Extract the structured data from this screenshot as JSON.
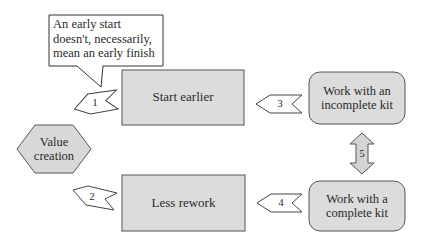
{
  "callout": {
    "text": "An early start doesn't, necessarily, mean an early finish"
  },
  "nodes": {
    "start_earlier": "Start earlier",
    "less_rework": "Less rework",
    "incomplete_kit": "Work with an incomplete kit",
    "complete_kit": "Work with a complete kit",
    "value_creation": "Value creation"
  },
  "arrows": {
    "a1": "1",
    "a2": "2",
    "a3": "3",
    "a4": "4",
    "a5": "5"
  },
  "colors": {
    "box_fill": "#dcdcdc",
    "box_stroke": "#555555",
    "arrow_fill": "#ffffff",
    "double_arrow_fill": "#d4d4d4",
    "text": "#2a2a2a"
  }
}
